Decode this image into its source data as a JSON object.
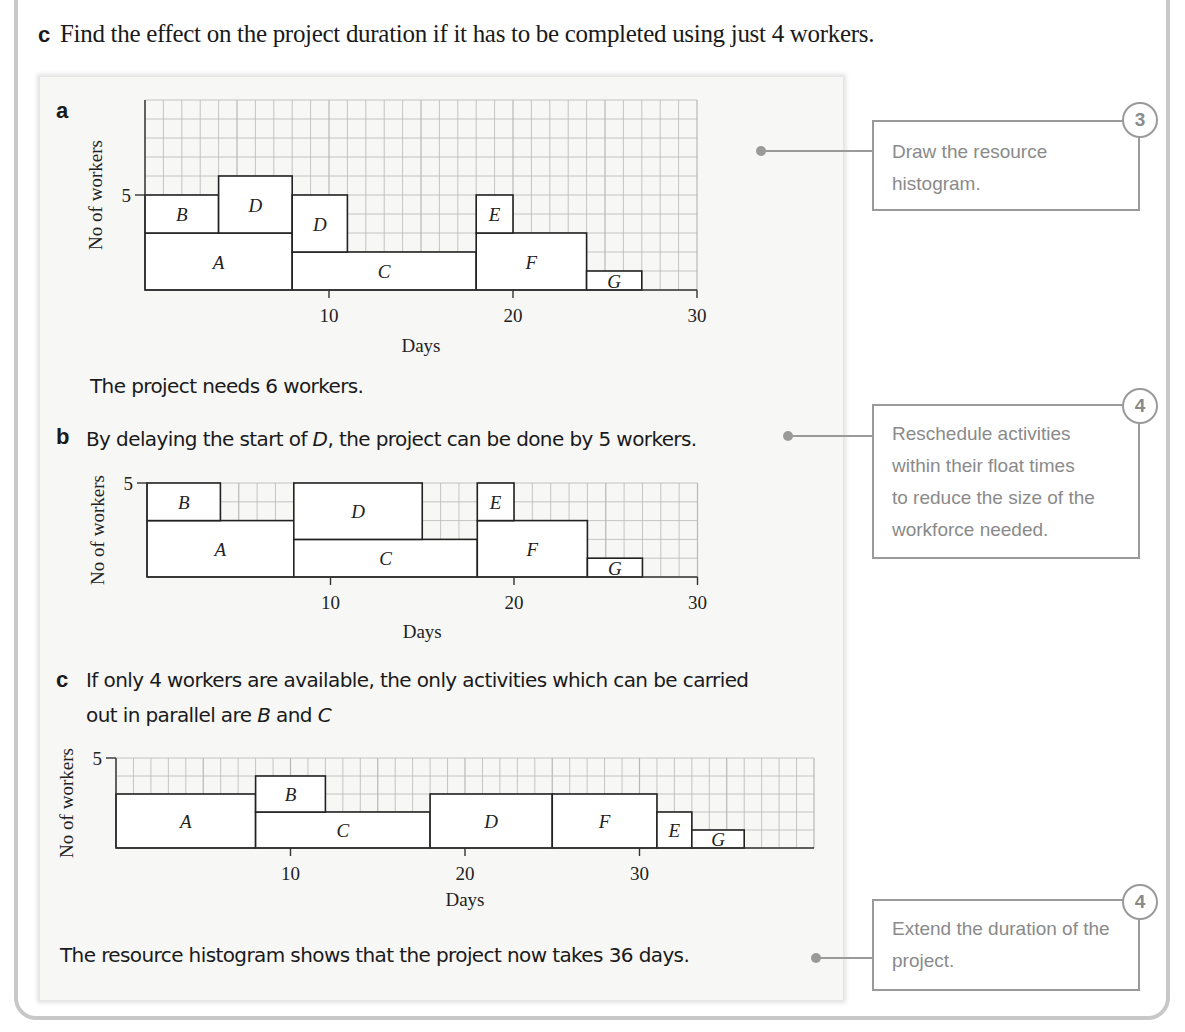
{
  "question": {
    "label": "c",
    "text": "Find the effect on the project duration if it has to be completed using just 4 workers."
  },
  "parts": {
    "a": {
      "label": "a",
      "answer": "The project needs 6 workers."
    },
    "b": {
      "label": "b",
      "answer_pre": "By delaying the start of ",
      "answer_em": "D",
      "answer_post": ", the project can be done by 5 workers."
    },
    "c": {
      "label": "c",
      "line1": "If only 4 workers are available, the only activities which can be carried",
      "line2_pre": "out in parallel are ",
      "line2_em1": "B",
      "line2_mid": " and ",
      "line2_em2": "C",
      "conclusion": "The resource histogram shows that the project now takes 36 days."
    }
  },
  "callouts": [
    {
      "badge": "3",
      "text_lines": [
        "Draw the resource",
        "histogram."
      ]
    },
    {
      "badge": "4",
      "text_lines": [
        "Reschedule activities",
        "within their float times",
        "to reduce the size of the",
        "workforce needed."
      ]
    },
    {
      "badge": "4",
      "text_lines": [
        "Extend the duration of the",
        "project."
      ]
    }
  ],
  "chart_data": [
    {
      "type": "bar",
      "title": "a",
      "xlabel": "Days",
      "ylabel": "No of workers",
      "xlim": [
        0,
        30
      ],
      "ylim": [
        0,
        10
      ],
      "xticks": [
        10,
        20,
        30
      ],
      "yticks": [
        5
      ],
      "grid": true,
      "blocks": [
        {
          "label": "A",
          "start": 0,
          "end": 8,
          "bottom": 0,
          "top": 3
        },
        {
          "label": "B",
          "start": 0,
          "end": 4,
          "bottom": 3,
          "top": 5
        },
        {
          "label": "D",
          "start": 4,
          "end": 8,
          "bottom": 3,
          "top": 6
        },
        {
          "label": "C",
          "start": 8,
          "end": 18,
          "bottom": 0,
          "top": 2
        },
        {
          "label": "D",
          "start": 8,
          "end": 11,
          "bottom": 2,
          "top": 5
        },
        {
          "label": "F",
          "start": 18,
          "end": 24,
          "bottom": 0,
          "top": 3
        },
        {
          "label": "E",
          "start": 18,
          "end": 20,
          "bottom": 3,
          "top": 5
        },
        {
          "label": "G",
          "start": 24,
          "end": 27,
          "bottom": 0,
          "top": 1
        }
      ]
    },
    {
      "type": "bar",
      "title": "b",
      "xlabel": "Days",
      "ylabel": "No of workers",
      "xlim": [
        0,
        30
      ],
      "ylim": [
        0,
        5
      ],
      "xticks": [
        10,
        20,
        30
      ],
      "yticks": [
        5
      ],
      "grid": true,
      "blocks": [
        {
          "label": "A",
          "start": 0,
          "end": 8,
          "bottom": 0,
          "top": 3
        },
        {
          "label": "B",
          "start": 0,
          "end": 4,
          "bottom": 3,
          "top": 5
        },
        {
          "label": "C",
          "start": 8,
          "end": 18,
          "bottom": 0,
          "top": 2
        },
        {
          "label": "D",
          "start": 8,
          "end": 15,
          "bottom": 2,
          "top": 5
        },
        {
          "label": "F",
          "start": 18,
          "end": 24,
          "bottom": 0,
          "top": 3
        },
        {
          "label": "E",
          "start": 18,
          "end": 20,
          "bottom": 3,
          "top": 5
        },
        {
          "label": "G",
          "start": 24,
          "end": 27,
          "bottom": 0,
          "top": 1
        }
      ]
    },
    {
      "type": "bar",
      "title": "c",
      "xlabel": "Days",
      "ylabel": "No of workers",
      "xlim": [
        0,
        40
      ],
      "ylim": [
        0,
        5
      ],
      "xticks": [
        10,
        20,
        30
      ],
      "yticks": [
        5
      ],
      "grid": true,
      "blocks": [
        {
          "label": "A",
          "start": 0,
          "end": 8,
          "bottom": 0,
          "top": 3
        },
        {
          "label": "C",
          "start": 8,
          "end": 18,
          "bottom": 0,
          "top": 2
        },
        {
          "label": "B",
          "start": 8,
          "end": 12,
          "bottom": 2,
          "top": 4
        },
        {
          "label": "D",
          "start": 18,
          "end": 25,
          "bottom": 0,
          "top": 3
        },
        {
          "label": "F",
          "start": 25,
          "end": 31,
          "bottom": 0,
          "top": 3
        },
        {
          "label": "E",
          "start": 31,
          "end": 33,
          "bottom": 0,
          "top": 2
        },
        {
          "label": "G",
          "start": 33,
          "end": 36,
          "bottom": 0,
          "top": 1
        }
      ]
    }
  ]
}
